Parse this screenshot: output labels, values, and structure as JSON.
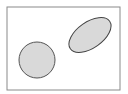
{
  "caption": "· · · · · ·  · · ·",
  "diagram": {
    "frame": {
      "x": 7,
      "y": 7,
      "width": 113,
      "height": 83,
      "stroke": "#8a8a8a"
    },
    "shapes": [
      {
        "name": "circle",
        "cx": 37,
        "cy": 60,
        "r": 18,
        "fill": "#d9d9d9",
        "stroke": "#555555"
      },
      {
        "name": "ellipse",
        "cx": 90,
        "cy": 35,
        "rx": 24,
        "ry": 13,
        "rotate": -35,
        "fill": "#d9d9d9",
        "stroke": "#444444"
      }
    ]
  }
}
